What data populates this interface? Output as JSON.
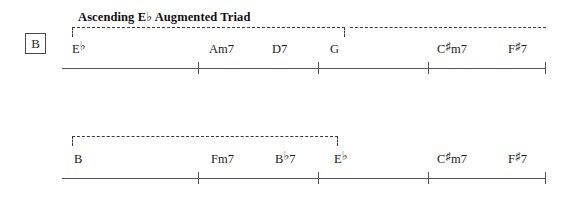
{
  "sheet": {
    "section_label": "B",
    "analysis_caption": "Ascending E♭ Augmented Triad"
  },
  "systems": [
    {
      "name": "system-1",
      "chords": [
        {
          "root": "E",
          "accidental": "♭",
          "suffix": "",
          "full": "E♭",
          "x": 72
        },
        {
          "root": "A",
          "accidental": "",
          "suffix": "m7",
          "full": "Am7",
          "x": 209
        },
        {
          "root": "D",
          "accidental": "",
          "suffix": "7",
          "full": "D7",
          "x": 272
        },
        {
          "root": "G",
          "accidental": "",
          "suffix": "",
          "full": "G",
          "x": 330
        },
        {
          "root": "C",
          "accidental": "♯",
          "suffix": "m7",
          "full": "C♯m7",
          "x": 437
        },
        {
          "root": "F",
          "accidental": "♯",
          "suffix": "7",
          "full": "F♯7",
          "x": 508
        }
      ],
      "barlines": [
        198,
        318,
        428,
        545
      ]
    },
    {
      "name": "system-2",
      "chords": [
        {
          "root": "B",
          "accidental": "",
          "suffix": "",
          "full": "B",
          "x": 74
        },
        {
          "root": "F",
          "accidental": "",
          "suffix": "m7",
          "full": "Fm7",
          "x": 211
        },
        {
          "root": "B",
          "accidental": "♭",
          "suffix": "7",
          "full": "B♭7",
          "x": 275
        },
        {
          "root": "E",
          "accidental": "♭",
          "suffix": "",
          "full": "E♭",
          "x": 334
        },
        {
          "root": "C",
          "accidental": "♯",
          "suffix": "m7",
          "full": "C♯m7",
          "x": 437
        },
        {
          "root": "F",
          "accidental": "♯",
          "suffix": "7",
          "full": "F♯7",
          "x": 508
        }
      ],
      "barlines": [
        198,
        318,
        428,
        545
      ]
    }
  ],
  "colors": {
    "ink": "#1a1a1a",
    "rule": "#555555",
    "dashed": "#3b3b3b"
  }
}
